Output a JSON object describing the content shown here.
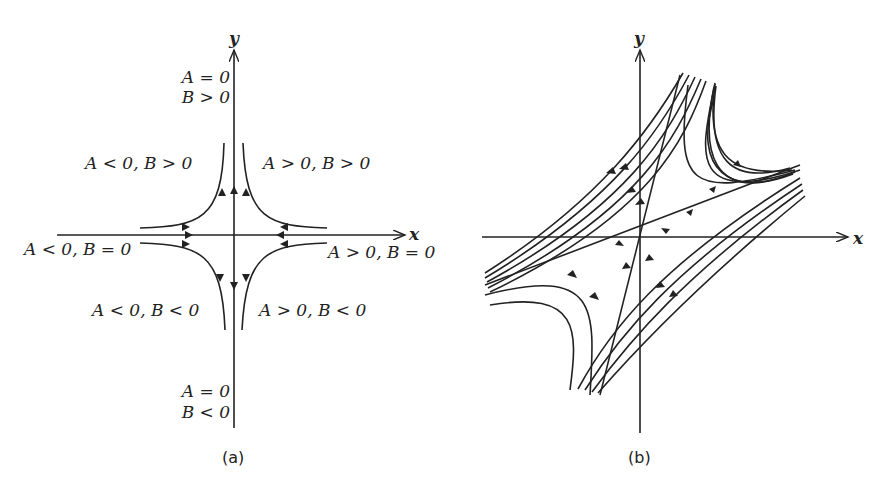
{
  "panel_a": {
    "caption": "(a)",
    "x_axis_label": "x",
    "y_axis_label": "y",
    "regions": {
      "top_axis_line1": "A = 0",
      "top_axis_line2": "B > 0",
      "upper_left": "A < 0, B > 0",
      "upper_right": "A > 0, B > 0",
      "left_axis": "A < 0, B = 0",
      "right_axis": "A > 0, B = 0",
      "lower_left": "A < 0, B < 0",
      "lower_right": "A > 0, B < 0",
      "bottom_axis_line1": "A = 0",
      "bottom_axis_line2": "B < 0"
    }
  },
  "panel_b": {
    "caption": "(b)",
    "x_axis_label": "x",
    "y_axis_label": "y"
  },
  "colors": {
    "ink": "#222222",
    "background": "#ffffff"
  }
}
